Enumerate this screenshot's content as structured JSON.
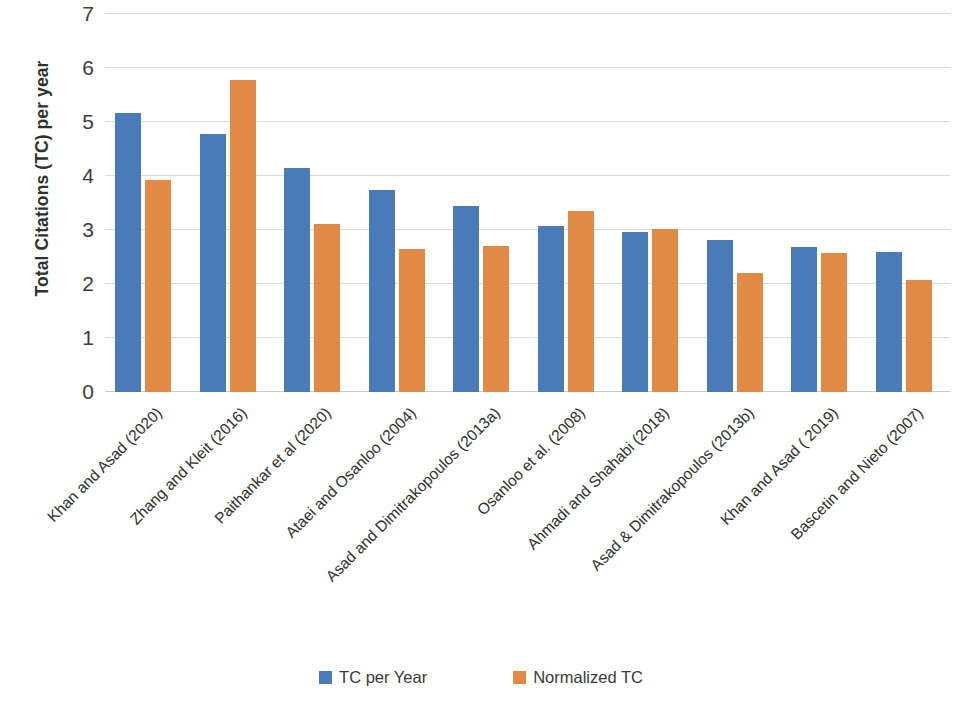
{
  "chart_data": {
    "type": "bar",
    "title": "",
    "subtitle": "",
    "xlabel": "",
    "ylabel": "Total Citations (TC) per year",
    "ylim": [
      0,
      7
    ],
    "yticks": [
      0,
      1,
      2,
      3,
      4,
      5,
      6,
      7
    ],
    "ytick_labels": [
      "0",
      "1",
      "2",
      "3",
      "4",
      "5",
      "6",
      "7"
    ],
    "grid": true,
    "legend_position": "bottom",
    "orientation": "vertical",
    "categories": [
      "Khan and Asad (2020)",
      "Zhang and Kleit (2016)",
      "Paithankar et al (2020)",
      "Ataei and Osanloo (2004)",
      "Asad and Dimitrakopoulos (2013a)",
      "Osanloo et al. (2008)",
      "Ahmadi and Shahabi (2018)",
      "Asad & Dimitrakopoulos (2013b)",
      "Khan and Asad ( 2019)",
      "Bascetin and Nieto (2007)"
    ],
    "series": [
      {
        "name": "TC per Year",
        "color": "#4a7ab8",
        "values": [
          5.16,
          4.78,
          4.15,
          3.75,
          3.44,
          3.08,
          2.97,
          2.82,
          2.69,
          2.6
        ]
      },
      {
        "name": "Normalized TC",
        "color": "#e08a45",
        "values": [
          3.92,
          5.77,
          3.11,
          2.65,
          2.7,
          3.35,
          3.01,
          2.2,
          2.57,
          2.08
        ]
      }
    ]
  },
  "legend": {
    "entries": [
      {
        "label": "TC per Year",
        "color": "#4a7ab8",
        "swatch_name": "legend-swatch-tc-per-year"
      },
      {
        "label": "Normalized TC",
        "color": "#e08a45",
        "swatch_name": "legend-swatch-normalized-tc"
      }
    ]
  }
}
